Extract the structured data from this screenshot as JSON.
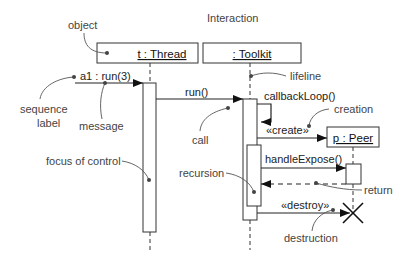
{
  "title": "Interaction",
  "objects": [
    {
      "id": "thread",
      "name": "t : Thread"
    },
    {
      "id": "toolkit",
      "name": ": Toolkit"
    },
    {
      "id": "peer",
      "name": "p : Peer"
    }
  ],
  "messages": [
    {
      "id": "m1",
      "label": "a1 : run(3)"
    },
    {
      "id": "m2",
      "label": "run()"
    },
    {
      "id": "m3",
      "label": "callbackLoop()"
    },
    {
      "id": "m4",
      "label": "«create»"
    },
    {
      "id": "m5",
      "label": "handleExpose()"
    },
    {
      "id": "m6",
      "label": "«destroy»"
    }
  ],
  "annotations": {
    "object": "object",
    "sequence_label_1": "sequence",
    "sequence_label_2": "label",
    "message": "message",
    "focus_of_control": "focus of control",
    "lifeline": "lifeline",
    "call": "call",
    "creation": "creation",
    "recursion": "recursion",
    "return": "return",
    "destruction": "destruction"
  },
  "colors": {
    "line": "#222222",
    "annotation_line": "#555555",
    "text": "#222222"
  }
}
